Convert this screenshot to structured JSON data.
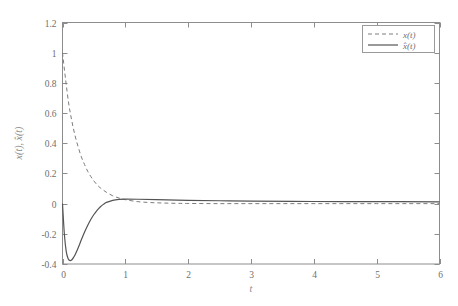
{
  "chart_data": {
    "type": "line",
    "title": "",
    "xlabel": "t",
    "ylabel": "x(t), x̂(t)",
    "xlim": [
      0,
      6
    ],
    "ylim": [
      -0.4,
      1.2
    ],
    "grid": false,
    "legend_position": "top-right",
    "xticks": [
      "0",
      "1",
      "2",
      "3",
      "4",
      "5",
      "6"
    ],
    "xtick_values": [
      0,
      1,
      2,
      3,
      4,
      5,
      6
    ],
    "yticks": [
      "-0.4",
      "-0.2",
      "0",
      "0.2",
      "0.4",
      "0.6",
      "0.8",
      "1",
      "1.2"
    ],
    "ytick_values": [
      -0.4,
      -0.2,
      0,
      0.2,
      0.4,
      0.6,
      0.8,
      1,
      1.2
    ],
    "series": [
      {
        "name": "x(t)",
        "style": "dashed",
        "color": "#7d7d7d",
        "x": [
          0.0,
          0.05,
          0.1,
          0.15,
          0.2,
          0.25,
          0.3,
          0.35,
          0.4,
          0.45,
          0.5,
          0.55,
          0.6,
          0.7,
          0.8,
          0.9,
          1.0,
          1.2,
          1.4,
          1.6,
          1.8,
          2.0,
          2.5,
          3.0,
          3.5,
          4.0,
          4.5,
          5.0,
          5.5,
          6.0
        ],
        "values": [
          1.0,
          0.82,
          0.66,
          0.545,
          0.45,
          0.375,
          0.31,
          0.26,
          0.215,
          0.18,
          0.15,
          0.125,
          0.105,
          0.075,
          0.052,
          0.037,
          0.026,
          0.013,
          0.007,
          0.004,
          0.002,
          0.001,
          0.0,
          0.0,
          0.0,
          0.0,
          0.0,
          0.0,
          0.0,
          0.0
        ]
      },
      {
        "name": "x̂(t)",
        "style": "solid",
        "color": "#545454",
        "x": [
          0.0,
          0.03,
          0.06,
          0.09,
          0.12,
          0.15,
          0.18,
          0.21,
          0.25,
          0.3,
          0.35,
          0.4,
          0.45,
          0.5,
          0.55,
          0.6,
          0.65,
          0.7,
          0.8,
          0.9,
          1.0,
          1.2,
          1.5,
          2.0,
          2.5,
          3.0,
          4.0,
          5.0,
          6.0
        ],
        "values": [
          0.0,
          -0.205,
          -0.318,
          -0.365,
          -0.378,
          -0.372,
          -0.354,
          -0.33,
          -0.292,
          -0.24,
          -0.19,
          -0.145,
          -0.105,
          -0.072,
          -0.044,
          -0.022,
          -0.005,
          0.008,
          0.022,
          0.028,
          0.03,
          0.029,
          0.026,
          0.022,
          0.019,
          0.017,
          0.014,
          0.013,
          0.012
        ]
      }
    ],
    "legend_entries": [
      {
        "label": "x(t)",
        "style": "dashed"
      },
      {
        "label": "x̂(t)",
        "style": "solid"
      }
    ]
  }
}
